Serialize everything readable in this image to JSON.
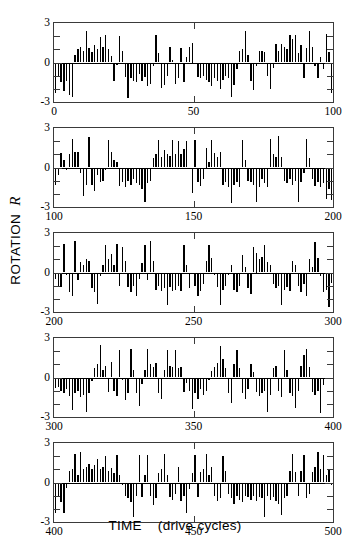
{
  "figure": {
    "width": 350,
    "height": 551,
    "background": "#ffffff",
    "bar_color": "#000000",
    "axis_color": "#3a3a3a"
  },
  "axes": {
    "ylabel_text": "ROTATION",
    "ylabel_symbol": "R",
    "xlabel_text": "TIME",
    "xlabel_units": "(drive cycles)",
    "ytick_labels": [
      "3",
      "0",
      "-3"
    ],
    "ytick_values": [
      3,
      0,
      -3
    ],
    "yminor_values": [
      2,
      1,
      -1,
      -2
    ],
    "ylim": [
      -3,
      3
    ]
  },
  "chart_data": {
    "type": "bar",
    "title": "",
    "subtitle": "",
    "xlabel": "TIME (drive cycles)",
    "ylabel": "ROTATION R",
    "ylim": [
      -3,
      3
    ],
    "grid": false,
    "legend": null,
    "annotations": [],
    "panels": [
      {
        "index": 0,
        "xlim": [
          0,
          100
        ],
        "xtick_labels": [
          "0",
          "50",
          "100"
        ],
        "xtick_values": [
          0,
          50,
          100
        ],
        "x": [
          0,
          1,
          2,
          3,
          4,
          5,
          6,
          7,
          8,
          9,
          10,
          11,
          12,
          13,
          14,
          15,
          16,
          17,
          18,
          19,
          20,
          21,
          22,
          23,
          24,
          25,
          26,
          27,
          28,
          29,
          30,
          31,
          32,
          33,
          34,
          35,
          36,
          37,
          38,
          39,
          40,
          41,
          42,
          43,
          44,
          45,
          46,
          47,
          48,
          49,
          50,
          51,
          52,
          53,
          54,
          55,
          56,
          57,
          58,
          59,
          60,
          61,
          62,
          63,
          64,
          65,
          66,
          67,
          68,
          69,
          70,
          71,
          72,
          73,
          74,
          75,
          76,
          77,
          78,
          79,
          80,
          81,
          82,
          83,
          84,
          85,
          86,
          87,
          88,
          89,
          90,
          91,
          92,
          93,
          94,
          95,
          96,
          97,
          98,
          99
        ],
        "values": [
          -2.3,
          -1.1,
          -1.5,
          -2.2,
          -1.4,
          -2.5,
          -2.6,
          0.6,
          1.0,
          1.2,
          0.9,
          2.4,
          1.1,
          0.8,
          1.3,
          1.0,
          1.9,
          1.2,
          2.1,
          1.0,
          0.5,
          -1.4,
          -0.2,
          2.0,
          0.9,
          -1.1,
          -2.7,
          -1.2,
          -1.4,
          -1.5,
          -0.9,
          -1.4,
          -1.1,
          -1.8,
          -1.6,
          -0.3,
          2.1,
          0.7,
          -1.9,
          -1.7,
          -1.0,
          1.2,
          0.2,
          -1.6,
          -1.2,
          1.1,
          -1.5,
          0.4,
          1.2,
          1.5,
          -0.1,
          -1.1,
          -1.2,
          -1.0,
          -1.3,
          -1.5,
          -1.8,
          -1.2,
          -1.4,
          -2.0,
          -1.3,
          -1.0,
          -1.2,
          -2.6,
          -1.7,
          -0.5,
          0.9,
          1.0,
          2.4,
          0.6,
          -1.4,
          -2.1,
          -0.3,
          0.9,
          0.9,
          0.8,
          -1.0,
          -2.0,
          -0.4,
          1.4,
          0.9,
          1.4,
          1.2,
          1.0,
          2.1,
          1.8,
          2.1,
          0.7,
          1.3,
          -1.2,
          1.1,
          2.4,
          1.2,
          -0.3,
          -1.2,
          0.4,
          -0.5,
          2.2,
          0.8,
          -2.3
        ]
      },
      {
        "index": 1,
        "xlim": [
          100,
          200
        ],
        "xtick_labels": [
          "100",
          "150",
          "200"
        ],
        "xtick_values": [
          100,
          150,
          200
        ],
        "x": [
          100,
          101,
          102,
          103,
          104,
          105,
          106,
          107,
          108,
          109,
          110,
          111,
          112,
          113,
          114,
          115,
          116,
          117,
          118,
          119,
          120,
          121,
          122,
          123,
          124,
          125,
          126,
          127,
          128,
          129,
          130,
          131,
          132,
          133,
          134,
          135,
          136,
          137,
          138,
          139,
          140,
          141,
          142,
          143,
          144,
          145,
          146,
          147,
          148,
          149,
          150,
          151,
          152,
          153,
          154,
          155,
          156,
          157,
          158,
          159,
          160,
          161,
          162,
          163,
          164,
          165,
          166,
          167,
          168,
          169,
          170,
          171,
          172,
          173,
          174,
          175,
          176,
          177,
          178,
          179,
          180,
          181,
          182,
          183,
          184,
          185,
          186,
          187,
          188,
          189,
          190,
          191,
          192,
          193,
          194,
          195,
          196,
          197,
          198,
          199
        ],
        "values": [
          -1.3,
          -0.6,
          1.1,
          0.6,
          -0.2,
          1.0,
          2.2,
          1.2,
          1.2,
          -0.4,
          -2.2,
          -1.3,
          2.3,
          -1.3,
          -1.8,
          -0.6,
          -1.1,
          -1.0,
          -0.2,
          2.1,
          1.2,
          0.6,
          0.4,
          -1.4,
          -1.1,
          -1.5,
          -1.0,
          -1.3,
          -0.9,
          -1.2,
          -1.3,
          -1.6,
          -2.6,
          -1.2,
          -1.0,
          0.7,
          1.0,
          2.1,
          0.8,
          1.3,
          1.0,
          0.9,
          2.1,
          1.0,
          2.0,
          1.0,
          1.4,
          2.0,
          -0.1,
          -1.9,
          2.1,
          -1.1,
          -1.4,
          -0.9,
          1.5,
          0.4,
          2.1,
          1.1,
          0.8,
          1.2,
          -1.3,
          -1.1,
          -1.5,
          -2.7,
          -1.3,
          -1.1,
          -1.5,
          2.1,
          0.6,
          -1.0,
          -1.1,
          -1.3,
          -2.6,
          -1.5,
          -0.9,
          -1.2,
          -1.5,
          2.2,
          1.0,
          0.8,
          2.4,
          0.8,
          -1.0,
          -1.2,
          -0.9,
          -1.3,
          -1.0,
          -2.6,
          -1.1,
          -0.4,
          2.2,
          0.7,
          -0.9,
          -1.4,
          -1.1,
          -1.5,
          -1.2,
          -2.4,
          -1.6,
          -2.5
        ]
      },
      {
        "index": 2,
        "xlim": [
          200,
          300
        ],
        "xtick_labels": [
          "200",
          "250",
          "300"
        ],
        "xtick_values": [
          200,
          250,
          300
        ],
        "x": [
          200,
          201,
          202,
          203,
          204,
          205,
          206,
          207,
          208,
          209,
          210,
          211,
          212,
          213,
          214,
          215,
          216,
          217,
          218,
          219,
          220,
          221,
          222,
          223,
          224,
          225,
          226,
          227,
          228,
          229,
          230,
          231,
          232,
          233,
          234,
          235,
          236,
          237,
          238,
          239,
          240,
          241,
          242,
          243,
          244,
          245,
          246,
          247,
          248,
          249,
          250,
          251,
          252,
          253,
          254,
          255,
          256,
          257,
          258,
          259,
          260,
          261,
          262,
          263,
          264,
          265,
          266,
          267,
          268,
          269,
          270,
          271,
          272,
          273,
          274,
          275,
          276,
          277,
          278,
          279,
          280,
          281,
          282,
          283,
          284,
          285,
          286,
          287,
          288,
          289,
          290,
          291,
          292,
          293,
          294,
          295,
          296,
          297,
          298,
          299
        ],
        "values": [
          -0.5,
          -1.0,
          -1.1,
          2.2,
          -0.2,
          -1.5,
          -1.8,
          2.4,
          -0.6,
          0.8,
          0.6,
          1.0,
          0.9,
          -1.2,
          -1.5,
          -2.4,
          -0.3,
          0.6,
          2.1,
          1.0,
          1.4,
          0.6,
          2.2,
          -1.0,
          1.9,
          0.9,
          -1.1,
          -1.5,
          -1.0,
          -1.8,
          -0.5,
          0.7,
          2.1,
          -0.6,
          2.4,
          0.9,
          -1.3,
          -1.0,
          -1.4,
          -1.2,
          -2.5,
          -1.1,
          -1.4,
          -1.3,
          -1.0,
          -1.4,
          2.1,
          0.6,
          -1.2,
          -0.1,
          -1.0,
          -1.8,
          -1.4,
          -0.9,
          0.9,
          2.1,
          1.1,
          -0.2,
          -1.1,
          -2.5,
          -1.3,
          -1.0,
          -0.2,
          0.6,
          -1.3,
          -1.5,
          -1.0,
          1.3,
          0.4,
          -1.2,
          -1.6,
          1.9,
          1.5,
          1.0,
          1.2,
          2.1,
          0.8,
          0.6,
          -0.9,
          -1.2,
          -1.0,
          -2.5,
          -1.3,
          -1.1,
          -1.4,
          0.9,
          0.6,
          -1.0,
          -1.5,
          -0.9,
          -1.8,
          1.0,
          0.4,
          2.3,
          1.1,
          -0.3,
          -1.5,
          -1.3,
          -2.6,
          -0.8
        ]
      },
      {
        "index": 3,
        "xlim": [
          300,
          400
        ],
        "xtick_labels": [
          "300",
          "350",
          "400"
        ],
        "xtick_values": [
          300,
          350,
          400
        ],
        "x": [
          300,
          301,
          302,
          303,
          304,
          305,
          306,
          307,
          308,
          309,
          310,
          311,
          312,
          313,
          314,
          315,
          316,
          317,
          318,
          319,
          320,
          321,
          322,
          323,
          324,
          325,
          326,
          327,
          328,
          329,
          330,
          331,
          332,
          333,
          334,
          335,
          336,
          337,
          338,
          339,
          340,
          341,
          342,
          343,
          344,
          345,
          346,
          347,
          348,
          349,
          350,
          351,
          352,
          353,
          354,
          355,
          356,
          357,
          358,
          359,
          360,
          361,
          362,
          363,
          364,
          365,
          366,
          367,
          368,
          369,
          370,
          371,
          372,
          373,
          374,
          375,
          376,
          377,
          378,
          379,
          380,
          381,
          382,
          383,
          384,
          385,
          386,
          387,
          388,
          389,
          390,
          391,
          392,
          393,
          394,
          395,
          396,
          397,
          398,
          399
        ],
        "values": [
          -0.8,
          -0.7,
          -1.0,
          -1.2,
          -0.9,
          -1.4,
          -2.5,
          -1.2,
          -1.0,
          -1.5,
          -1.3,
          -2.6,
          -1.2,
          -0.3,
          0.7,
          1.0,
          2.5,
          0.6,
          0.9,
          -1.1,
          1.2,
          -1.0,
          -1.4,
          2.1,
          -0.2,
          -1.7,
          -1.2,
          2.2,
          0.6,
          -1.2,
          -2.2,
          -0.5,
          0.6,
          2.2,
          1.0,
          0.8,
          1.1,
          -1.2,
          -1.6,
          0.6,
          2.1,
          0.9,
          0.8,
          2.1,
          0.7,
          0.8,
          -1.1,
          -0.4,
          -1.0,
          -2.4,
          -1.2,
          -1.6,
          -0.9,
          -1.3,
          -1.0,
          -0.2,
          0.5,
          0.8,
          1.1,
          2.4,
          1.4,
          0.7,
          -1.2,
          -1.9,
          1.0,
          2.1,
          0.7,
          -1.2,
          -1.6,
          -0.9,
          1.0,
          0.4,
          -1.1,
          -1.4,
          -1.2,
          -1.0,
          -2.6,
          -1.3,
          0.7,
          0.9,
          -1.0,
          -1.5,
          2.1,
          0.6,
          -1.2,
          -1.4,
          -2.3,
          -1.0,
          0.9,
          1.7,
          2.2,
          0.8,
          -1.1,
          -1.3,
          -1.0,
          -2.7,
          -0.6
        ]
      },
      {
        "index": 4,
        "xlim": [
          400,
          500
        ],
        "xtick_labels": [
          "400",
          "450",
          "500"
        ],
        "xtick_values": [
          400,
          450,
          500
        ],
        "x": [
          400,
          401,
          402,
          403,
          404,
          405,
          406,
          407,
          408,
          409,
          410,
          411,
          412,
          413,
          414,
          415,
          416,
          417,
          418,
          419,
          420,
          421,
          422,
          423,
          424,
          425,
          426,
          427,
          428,
          429,
          430,
          431,
          432,
          433,
          434,
          435,
          436,
          437,
          438,
          439,
          440,
          441,
          442,
          443,
          444,
          445,
          446,
          447,
          448,
          449,
          450,
          451,
          452,
          453,
          454,
          455,
          456,
          457,
          458,
          459,
          460,
          461,
          462,
          463,
          464,
          465,
          466,
          467,
          468,
          469,
          470,
          471,
          472,
          473,
          474,
          475,
          476,
          477,
          478,
          479,
          480,
          481,
          482,
          483,
          484,
          485,
          486,
          487,
          488,
          489,
          490,
          491,
          492,
          493,
          494,
          495,
          496,
          497,
          498,
          499
        ],
        "values": [
          -2.3,
          -1.1,
          -1.5,
          -2.3,
          -0.4,
          0.9,
          1.0,
          2.2,
          0.6,
          2.3,
          1.0,
          1.2,
          1.4,
          1.0,
          1.3,
          1.8,
          1.0,
          1.2,
          2.0,
          0.9,
          1.1,
          0.7,
          2.1,
          0.6,
          -0.2,
          -1.0,
          -1.2,
          -1.5,
          -2.6,
          -1.0,
          2.1,
          -1.1,
          0.6,
          2.1,
          -1.0,
          -1.7,
          -1.2,
          0.7,
          1.0,
          2.2,
          0.6,
          -1.1,
          -1.3,
          -0.9,
          1.2,
          -1.4,
          -1.0,
          -2.3,
          -0.5,
          0.7,
          2.1,
          -1.1,
          0.8,
          1.0,
          2.2,
          0.6,
          1.2,
          -1.0,
          -1.4,
          -1.2,
          2.0,
          0.9,
          -0.9,
          -1.2,
          -1.6,
          -1.0,
          -1.3,
          -1.5,
          -1.0,
          -1.1,
          -1.3,
          -1.0,
          -1.4,
          -1.1,
          -1.2,
          -2.6,
          -1.0,
          -1.3,
          -1.1,
          -1.4,
          -1.6,
          -2.5,
          -1.2,
          -1.0,
          0.9,
          2.2,
          0.8,
          -1.0,
          0.9,
          2.1,
          -1.2,
          -0.9,
          0.8,
          1.2,
          2.3,
          1.0,
          2.1,
          0.6,
          1.0,
          -0.2
        ]
      }
    ]
  }
}
